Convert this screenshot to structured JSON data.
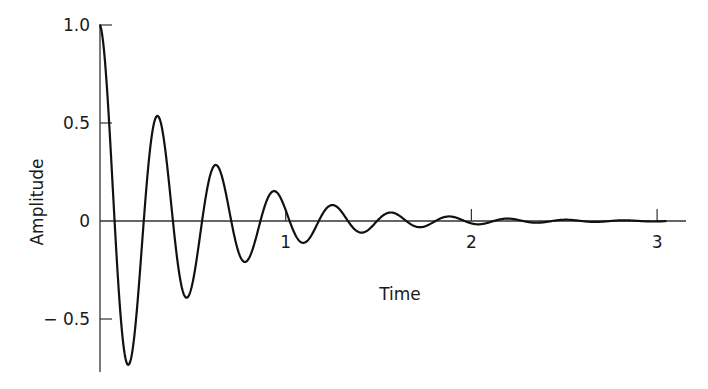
{
  "chart_data": {
    "type": "line",
    "title": "",
    "xlabel": "Time",
    "ylabel": "Amplitude",
    "xlim": [
      0,
      3.1
    ],
    "ylim": [
      -0.76,
      1.0
    ],
    "grid": false,
    "legend": null,
    "x_ticks": [
      {
        "value": 1,
        "label": "1"
      },
      {
        "value": 2,
        "label": "2"
      },
      {
        "value": 3,
        "label": "3"
      }
    ],
    "y_ticks": [
      {
        "value": 1.0,
        "label": "1.0"
      },
      {
        "value": 0.5,
        "label": "0.5"
      },
      {
        "value": 0,
        "label": "0"
      },
      {
        "value": -0.5,
        "label": "− 0.5"
      }
    ],
    "series": [
      {
        "name": "Damped oscillation",
        "description": "Exponentially decaying cosine, approx. y = e^(-2t) cos(20t)",
        "decay_rate": 2.0,
        "angular_frequency": 20.0,
        "color": "#111111",
        "key_points": [
          {
            "x": 0.0,
            "y": 1.0
          },
          {
            "x": 0.157,
            "y": -0.73
          },
          {
            "x": 0.314,
            "y": 0.53
          },
          {
            "x": 0.471,
            "y": -0.39
          },
          {
            "x": 0.628,
            "y": 0.285
          },
          {
            "x": 0.785,
            "y": -0.21
          },
          {
            "x": 0.942,
            "y": 0.15
          },
          {
            "x": 1.1,
            "y": -0.11
          },
          {
            "x": 1.257,
            "y": 0.08
          },
          {
            "x": 1.414,
            "y": -0.06
          },
          {
            "x": 1.571,
            "y": 0.043
          },
          {
            "x": 1.728,
            "y": -0.032
          },
          {
            "x": 1.885,
            "y": 0.023
          },
          {
            "x": 2.042,
            "y": -0.017
          },
          {
            "x": 2.2,
            "y": 0.012
          },
          {
            "x": 2.5,
            "y": 0.005
          },
          {
            "x": 3.0,
            "y": 0.0
          }
        ]
      }
    ]
  }
}
